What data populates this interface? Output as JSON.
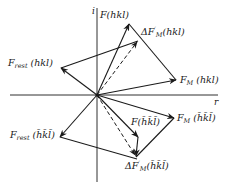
{
  "diagram": {
    "axes": {
      "imag_label": "i",
      "real_label": "r"
    },
    "labels": {
      "f_hkl": {
        "main": "F",
        "args": "(hkl)"
      },
      "delta_f_hkl": {
        "prefix": "ΔF",
        "sub": "M",
        "sup": "′",
        "args": "(hkl)"
      },
      "f_rest_hkl": {
        "main": "F",
        "sub": "rest",
        "args": "(hkl)"
      },
      "f_m_hkl": {
        "main": "F",
        "sub": "M",
        "args": "(hkl)"
      },
      "f_rest_bar": {
        "main": "F",
        "sub": "rest",
        "args": "(h̄k̄l̄)"
      },
      "f_bar": {
        "main": "F",
        "args": "(h̄k̄l̄)"
      },
      "f_m_bar": {
        "main": "F",
        "sub": "M",
        "args": "(h̄k̄l̄)"
      },
      "delta_f_bar": {
        "prefix": "ΔF",
        "sub": "M",
        "sup": "′",
        "args": "(h̄k̄l̄)"
      }
    },
    "colors": {
      "line": "#1a1a1a",
      "background": "#ffffff"
    }
  }
}
